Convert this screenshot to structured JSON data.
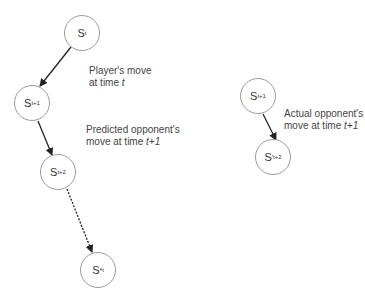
{
  "diagram": {
    "nodes": [
      {
        "id": "s_t",
        "base": "S",
        "sup": "",
        "sub": "t",
        "cx": 82,
        "cy": 33
      },
      {
        "id": "s_t1",
        "base": "S",
        "sup": "",
        "sub": "t+1",
        "cx": 32,
        "cy": 103
      },
      {
        "id": "s_t2",
        "base": "S",
        "sup": "",
        "sub": "t+2",
        "cx": 58,
        "cy": 172
      },
      {
        "id": "s_star_t",
        "base": "S",
        "sup": "*",
        "sub": "t",
        "cx": 98,
        "cy": 270
      },
      {
        "id": "s_t1_actual",
        "base": "S",
        "sup": "",
        "sub": "t+1",
        "cx": 258,
        "cy": 96
      },
      {
        "id": "s_prime_t2",
        "base": "S",
        "sup": "'",
        "sub": "t+2",
        "cx": 273,
        "cy": 157
      }
    ],
    "edges": [
      {
        "from": "s_t",
        "to": "s_t1",
        "style": "solid"
      },
      {
        "from": "s_t1",
        "to": "s_t2",
        "style": "solid"
      },
      {
        "from": "s_t2",
        "to": "s_star_t",
        "style": "dashed"
      },
      {
        "from": "s_t1_actual",
        "to": "s_prime_t2",
        "style": "solid"
      }
    ],
    "labels": {
      "player_move_line1": "Player's move",
      "player_move_line2_prefix": "at time ",
      "player_move_line2_var": "t",
      "predicted_line1": "Predicted opponent's",
      "predicted_line2_prefix": "move at time ",
      "predicted_line2_var": "t+1",
      "actual_line1": "Actual opponent's",
      "actual_line2_prefix": "move at time ",
      "actual_line2_var": "t+1"
    },
    "node_text": {
      "s_t": {
        "base": "S",
        "sup": "",
        "sub": "t"
      },
      "s_t1": {
        "base": "S",
        "sup": "",
        "sub": "t+1"
      },
      "s_t2": {
        "base": "S",
        "sup": "",
        "sub": "t+2"
      },
      "s_star_t": {
        "base": "S",
        "sup": "*",
        "sub": "t"
      },
      "s_t1_actual": {
        "base": "S",
        "sup": "",
        "sub": "t+1"
      },
      "s_prime_t2": {
        "base": "S",
        "sup": "'",
        "sub": "t+2"
      }
    },
    "colors": {
      "edge": "#222222",
      "node_border": "#9a9a9a",
      "text": "#333333"
    }
  }
}
